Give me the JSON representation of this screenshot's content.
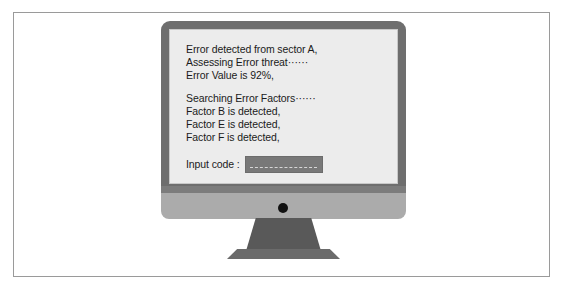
{
  "scene": {
    "description": "illustration-of-desktop-computer-with-error-message"
  },
  "monitor": {
    "power_dot": "power-indicator"
  },
  "screen": {
    "terminal_lines": [
      "Error detected from sector A,",
      "Assessing Error threat······",
      "Error Value is 92%,",
      "",
      "Searching Error Factors······",
      "Factor B is detected,",
      "Factor E is detected,",
      "Factor F is detected,"
    ],
    "input": {
      "label": "Input code :",
      "value": "",
      "placeholder": ""
    }
  },
  "colors": {
    "screen_background": "#ececec",
    "bezel": "#6e6e6e",
    "chin": "#ababab",
    "stand": "#595959",
    "stand_base": "#6b6b6b",
    "text": "#1b1b1b",
    "input_box": "#787878",
    "power_dot": "#111111",
    "frame_border": "#9a9a9a"
  }
}
